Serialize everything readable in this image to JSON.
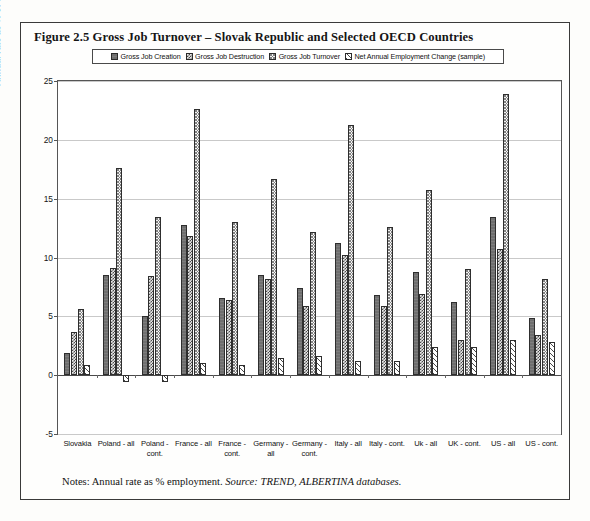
{
  "figure": {
    "title": "Figure 2.5  Gross Job Turnover – Slovak Republic and Selected OECD Countries",
    "notes_prefix": "Notes: Annual rate as % employment.",
    "notes_source_label": "Source:",
    "notes_source_value": "TREND, ALBERTINA databases."
  },
  "chart_data": {
    "type": "bar",
    "title": "Figure 2.5  Gross Job Turnover – Slovak Republic and Selected OECD Countries",
    "xlabel": "",
    "ylabel": "Annual rate as % of total employment",
    "ylim": [
      -5,
      25
    ],
    "yticks": [
      -5,
      0,
      5,
      10,
      15,
      20,
      25
    ],
    "grid": true,
    "legend_position": "top-center",
    "categories": [
      "Slovakia",
      "Poland - all",
      "Poland - cont.",
      "France - all",
      "France - cont.",
      "Germany - all",
      "Germany -cont.",
      "Italy - all",
      "Italy - cont.",
      "Uk - all",
      "UK - cont.",
      "US - all",
      "US - cont."
    ],
    "series": [
      {
        "name": "Gross Job Creation",
        "pattern": "solid-dark-grey",
        "values": [
          1.9,
          8.5,
          5.0,
          12.8,
          6.6,
          8.5,
          7.4,
          11.2,
          6.8,
          8.8,
          6.2,
          13.4,
          4.9
        ]
      },
      {
        "name": "Gross Job Destruction",
        "pattern": "dense-checker",
        "values": [
          3.7,
          9.1,
          8.4,
          11.8,
          6.4,
          8.2,
          5.9,
          10.2,
          5.9,
          6.9,
          3.0,
          10.7,
          3.4
        ]
      },
      {
        "name": "Gross Job Turnover",
        "pattern": "light-stipple",
        "values": [
          5.6,
          17.6,
          13.4,
          22.6,
          13.0,
          16.7,
          12.2,
          21.3,
          12.6,
          15.7,
          9.0,
          23.9,
          8.2
        ]
      },
      {
        "name": "Net Annual Employment Change (sample)",
        "pattern": "diagonal-hatch",
        "values": [
          0.9,
          -0.6,
          -0.6,
          1.0,
          0.9,
          1.5,
          1.6,
          1.2,
          1.2,
          2.4,
          2.4,
          3.0,
          2.8
        ]
      }
    ]
  }
}
